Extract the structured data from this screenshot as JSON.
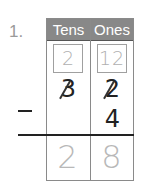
{
  "problem": {
    "number": "1.",
    "headers": {
      "tens": "Tens",
      "ones": "Ones"
    },
    "regroup": {
      "tens": "2",
      "ones": "12"
    },
    "minuend": {
      "tens": "3",
      "ones": "2",
      "tens_struck": true,
      "ones_struck": true
    },
    "subtrahend": {
      "tens": "",
      "ones": "4"
    },
    "operator": "−",
    "answer": {
      "tens": "2",
      "ones": "8"
    }
  },
  "colors": {
    "header_bg": "#888888",
    "header_text": "#ffffff",
    "trace_text": "#b8b8b8",
    "ink": "#222222"
  }
}
